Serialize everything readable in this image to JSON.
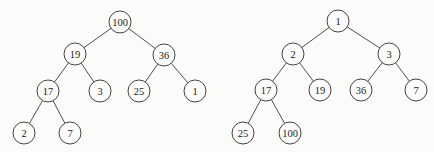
{
  "trees": [
    {
      "name": "max-heap",
      "nodes": [
        {
          "id": "a0",
          "label": "100",
          "x": 120,
          "y": 22
        },
        {
          "id": "a1",
          "label": "19",
          "x": 75,
          "y": 54
        },
        {
          "id": "a2",
          "label": "36",
          "x": 164,
          "y": 55
        },
        {
          "id": "a3",
          "label": "17",
          "x": 48,
          "y": 91
        },
        {
          "id": "a4",
          "label": "3",
          "x": 100,
          "y": 91
        },
        {
          "id": "a5",
          "label": "25",
          "x": 139,
          "y": 91
        },
        {
          "id": "a6",
          "label": "1",
          "x": 195,
          "y": 91
        },
        {
          "id": "a7",
          "label": "2",
          "x": 24,
          "y": 133
        },
        {
          "id": "a8",
          "label": "7",
          "x": 70,
          "y": 133
        }
      ],
      "edges": [
        [
          "a0",
          "a1"
        ],
        [
          "a0",
          "a2"
        ],
        [
          "a1",
          "a3"
        ],
        [
          "a1",
          "a4"
        ],
        [
          "a2",
          "a5"
        ],
        [
          "a2",
          "a6"
        ],
        [
          "a3",
          "a7"
        ],
        [
          "a3",
          "a8"
        ]
      ]
    },
    {
      "name": "min-heap",
      "nodes": [
        {
          "id": "b0",
          "label": "1",
          "x": 338,
          "y": 21
        },
        {
          "id": "b1",
          "label": "2",
          "x": 293,
          "y": 54
        },
        {
          "id": "b2",
          "label": "3",
          "x": 389,
          "y": 54
        },
        {
          "id": "b3",
          "label": "17",
          "x": 266,
          "y": 90
        },
        {
          "id": "b4",
          "label": "19",
          "x": 320,
          "y": 90
        },
        {
          "id": "b5",
          "label": "36",
          "x": 361,
          "y": 90
        },
        {
          "id": "b6",
          "label": "7",
          "x": 416,
          "y": 90
        },
        {
          "id": "b7",
          "label": "25",
          "x": 243,
          "y": 133
        },
        {
          "id": "b8",
          "label": "100",
          "x": 290,
          "y": 133
        }
      ],
      "edges": [
        [
          "b0",
          "b1"
        ],
        [
          "b0",
          "b2"
        ],
        [
          "b1",
          "b3"
        ],
        [
          "b1",
          "b4"
        ],
        [
          "b2",
          "b5"
        ],
        [
          "b2",
          "b6"
        ],
        [
          "b3",
          "b7"
        ],
        [
          "b3",
          "b8"
        ]
      ]
    }
  ],
  "style": {
    "node_radius": 11,
    "stroke_color": "#2e2e2e",
    "background": "#fbfbfa"
  }
}
